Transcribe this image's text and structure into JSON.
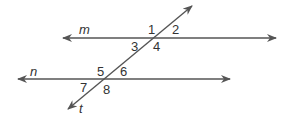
{
  "diagram": {
    "line_color": "#555555",
    "lines": [
      {
        "name": "m",
        "label": "m",
        "x1": 63,
        "y1": 38,
        "x2": 276,
        "y2": 38
      },
      {
        "name": "n",
        "label": "n",
        "x1": 18,
        "y1": 79,
        "x2": 230,
        "y2": 79
      },
      {
        "name": "t",
        "label": "t",
        "x1": 68,
        "y1": 109,
        "x2": 192,
        "y2": 6
      }
    ],
    "angles": [
      {
        "label": "1",
        "x": 148,
        "y": 34
      },
      {
        "label": "2",
        "x": 172,
        "y": 34
      },
      {
        "label": "3",
        "x": 131,
        "y": 51
      },
      {
        "label": "4",
        "x": 153,
        "y": 51
      },
      {
        "label": "5",
        "x": 97,
        "y": 76
      },
      {
        "label": "6",
        "x": 120,
        "y": 76
      },
      {
        "label": "7",
        "x": 80,
        "y": 92
      },
      {
        "label": "8",
        "x": 103,
        "y": 94
      }
    ],
    "line_labels": [
      {
        "label": "m",
        "x": 79,
        "y": 34
      },
      {
        "label": "n",
        "x": 30,
        "y": 76
      },
      {
        "label": "t",
        "x": 79,
        "y": 113
      }
    ]
  }
}
